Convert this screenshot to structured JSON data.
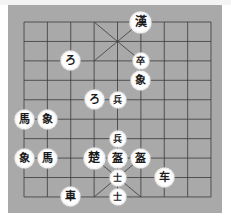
{
  "board": {
    "background": "#a9a9a9",
    "line_color": "#3a3a3a",
    "columns": 9,
    "rows": 10,
    "origin_x": 24,
    "origin_y": 22,
    "step_x": 23.375,
    "step_y": 19.44,
    "palaces": [
      {
        "col_from": 3,
        "col_to": 5,
        "row_from": 0,
        "row_to": 2
      },
      {
        "col_from": 3,
        "col_to": 5,
        "row_from": 7,
        "row_to": 9
      }
    ]
  },
  "pieces": [
    {
      "glyph": "漢",
      "name": "general-han",
      "col": 5,
      "row": 0,
      "size": "large"
    },
    {
      "glyph": "ろ",
      "name": "cannon",
      "col": 2,
      "row": 2,
      "size": "normal"
    },
    {
      "glyph": "卒",
      "name": "soldier",
      "col": 5,
      "row": 2,
      "size": "small"
    },
    {
      "glyph": "象",
      "name": "elephant",
      "col": 5,
      "row": 3,
      "size": "normal"
    },
    {
      "glyph": "ろ",
      "name": "cannon",
      "col": 3,
      "row": 4,
      "size": "normal"
    },
    {
      "glyph": "兵",
      "name": "soldier",
      "col": 4,
      "row": 4,
      "size": "small"
    },
    {
      "glyph": "馬",
      "name": "horse",
      "col": 0,
      "row": 5,
      "size": "normal"
    },
    {
      "glyph": "象",
      "name": "elephant",
      "col": 1,
      "row": 5,
      "size": "normal"
    },
    {
      "glyph": "兵",
      "name": "soldier",
      "col": 4,
      "row": 6,
      "size": "small"
    },
    {
      "glyph": "象",
      "name": "elephant",
      "col": 0,
      "row": 7,
      "size": "normal"
    },
    {
      "glyph": "馬",
      "name": "horse",
      "col": 1,
      "row": 7,
      "size": "normal"
    },
    {
      "glyph": "楚",
      "name": "general-chu",
      "col": 3,
      "row": 7,
      "size": "large"
    },
    {
      "glyph": "盔",
      "name": "cannon",
      "col": 4,
      "row": 7,
      "size": "normal"
    },
    {
      "glyph": "盔",
      "name": "cannon",
      "col": 5,
      "row": 7,
      "size": "normal"
    },
    {
      "glyph": "士",
      "name": "advisor",
      "col": 4,
      "row": 8,
      "size": "small"
    },
    {
      "glyph": "车",
      "name": "chariot",
      "col": 6,
      "row": 8,
      "size": "normal"
    },
    {
      "glyph": "士",
      "name": "advisor",
      "col": 4,
      "row": 9,
      "size": "small"
    },
    {
      "glyph": "車",
      "name": "chariot",
      "col": 2,
      "row": 9,
      "size": "normal"
    }
  ]
}
